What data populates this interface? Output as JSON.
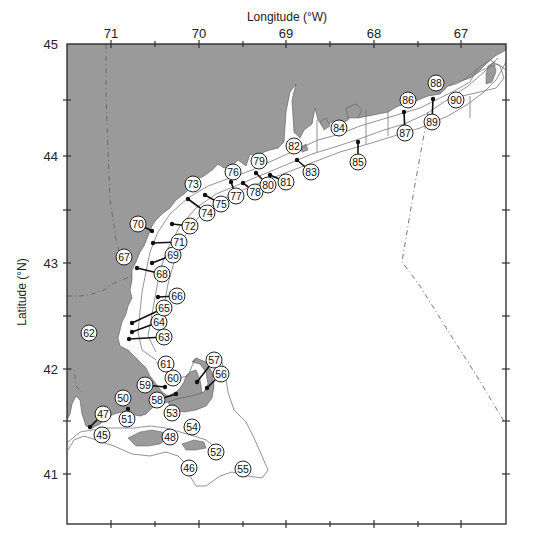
{
  "figure": {
    "x_axis_title": "Longitude (°W)",
    "y_axis_title": "Latitude (°N)",
    "x_ticks": [
      {
        "label": "71",
        "x": 111
      },
      {
        "label": "70",
        "x": 199
      },
      {
        "label": "69",
        "x": 286
      },
      {
        "label": "68",
        "x": 374
      },
      {
        "label": "67",
        "x": 461
      }
    ],
    "y_ticks": [
      {
        "label": "45",
        "y": 44
      },
      {
        "label": "44",
        "y": 156
      },
      {
        "label": "43",
        "y": 263
      },
      {
        "label": "42",
        "y": 369
      },
      {
        "label": "41",
        "y": 474
      }
    ],
    "colors": {
      "land": "#9a9a9a",
      "water": "#ffffff",
      "contour": "#777777",
      "frame": "#333333",
      "boundary_dash": "#666666"
    }
  },
  "stations": [
    {
      "id": "45",
      "label": "45",
      "lx": 102,
      "ly": 435
    },
    {
      "id": "46",
      "label": "46",
      "lx": 189,
      "ly": 468
    },
    {
      "id": "47",
      "label": "47",
      "lx": 103,
      "ly": 414,
      "dx": 90,
      "dy": 427
    },
    {
      "id": "48",
      "label": "48",
      "lx": 170,
      "ly": 437
    },
    {
      "id": "50",
      "label": "50",
      "lx": 123,
      "ly": 398
    },
    {
      "id": "51",
      "label": "51",
      "lx": 127,
      "ly": 419,
      "dx": 128,
      "dy": 409
    },
    {
      "id": "52",
      "label": "52",
      "lx": 216,
      "ly": 452
    },
    {
      "id": "53",
      "label": "53",
      "lx": 172,
      "ly": 413
    },
    {
      "id": "54",
      "label": "54",
      "lx": 192,
      "ly": 427
    },
    {
      "id": "55",
      "label": "55",
      "lx": 243,
      "ly": 469
    },
    {
      "id": "56",
      "label": "56",
      "lx": 221,
      "ly": 374,
      "dx": 207,
      "dy": 388
    },
    {
      "id": "57",
      "label": "57",
      "lx": 214,
      "ly": 360,
      "dx": 197,
      "dy": 382
    },
    {
      "id": "58",
      "label": "58",
      "lx": 157,
      "ly": 400,
      "dx": 176,
      "dy": 394
    },
    {
      "id": "59",
      "label": "59",
      "lx": 145,
      "ly": 385,
      "dx": 165,
      "dy": 387
    },
    {
      "id": "60",
      "label": "60",
      "lx": 173,
      "ly": 378
    },
    {
      "id": "61",
      "label": "61",
      "lx": 166,
      "ly": 364
    },
    {
      "id": "62",
      "label": "62",
      "lx": 89,
      "ly": 333
    },
    {
      "id": "63",
      "label": "63",
      "lx": 164,
      "ly": 337,
      "dx": 129,
      "dy": 339
    },
    {
      "id": "64",
      "label": "64",
      "lx": 159,
      "ly": 322,
      "dx": 132,
      "dy": 332
    },
    {
      "id": "65",
      "label": "65",
      "lx": 164,
      "ly": 308,
      "dx": 132,
      "dy": 323
    },
    {
      "id": "66",
      "label": "66",
      "lx": 177,
      "ly": 296,
      "dx": 158,
      "dy": 297
    },
    {
      "id": "67",
      "label": "67",
      "lx": 124,
      "ly": 257
    },
    {
      "id": "68",
      "label": "68",
      "lx": 162,
      "ly": 274,
      "dx": 137,
      "dy": 268
    },
    {
      "id": "69",
      "label": "69",
      "lx": 173,
      "ly": 255,
      "dx": 152,
      "dy": 263
    },
    {
      "id": "70",
      "label": "70",
      "lx": 138,
      "ly": 224,
      "dx": 152,
      "dy": 231
    },
    {
      "id": "71",
      "label": "71",
      "lx": 179,
      "ly": 242,
      "dx": 153,
      "dy": 243
    },
    {
      "id": "72",
      "label": "72",
      "lx": 190,
      "ly": 226,
      "dx": 172,
      "dy": 224
    },
    {
      "id": "73",
      "label": "73",
      "lx": 193,
      "ly": 184
    },
    {
      "id": "74",
      "label": "74",
      "lx": 207,
      "ly": 213,
      "dx": 188,
      "dy": 199
    },
    {
      "id": "75",
      "label": "75",
      "lx": 221,
      "ly": 204,
      "dx": 205,
      "dy": 195
    },
    {
      "id": "76",
      "label": "76",
      "lx": 233,
      "ly": 172
    },
    {
      "id": "77",
      "label": "77",
      "lx": 236,
      "ly": 196,
      "dx": 231,
      "dy": 182
    },
    {
      "id": "78",
      "label": "78",
      "lx": 255,
      "ly": 192,
      "dx": 243,
      "dy": 183
    },
    {
      "id": "79",
      "label": "79",
      "lx": 259,
      "ly": 161
    },
    {
      "id": "80",
      "label": "80",
      "lx": 268,
      "ly": 185,
      "dx": 256,
      "dy": 173
    },
    {
      "id": "81",
      "label": "81",
      "lx": 286,
      "ly": 182,
      "dx": 270,
      "dy": 175
    },
    {
      "id": "82",
      "label": "82",
      "lx": 294,
      "ly": 146
    },
    {
      "id": "83",
      "label": "83",
      "lx": 311,
      "ly": 172,
      "dx": 297,
      "dy": 160
    },
    {
      "id": "84",
      "label": "84",
      "lx": 339,
      "ly": 128
    },
    {
      "id": "85",
      "label": "85",
      "lx": 358,
      "ly": 162,
      "dx": 358,
      "dy": 142
    },
    {
      "id": "86",
      "label": "86",
      "lx": 408,
      "ly": 100
    },
    {
      "id": "87",
      "label": "87",
      "lx": 405,
      "ly": 133,
      "dx": 404,
      "dy": 112
    },
    {
      "id": "88",
      "label": "88",
      "lx": 436,
      "ly": 83
    },
    {
      "id": "89",
      "label": "89",
      "lx": 432,
      "ly": 122,
      "dx": 433,
      "dy": 99
    },
    {
      "id": "90",
      "label": "90",
      "lx": 456,
      "ly": 100
    }
  ]
}
